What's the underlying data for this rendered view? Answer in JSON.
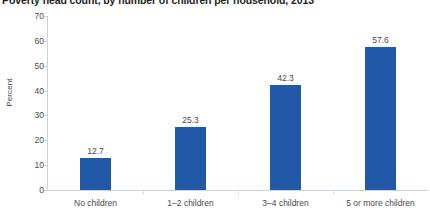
{
  "chart_data": {
    "type": "bar",
    "title": "Poverty head count, by number of children per household, 2013",
    "xlabel": "",
    "ylabel": "Percent",
    "categories": [
      "No children",
      "1–2 children",
      "3–4 children",
      "5 or more children"
    ],
    "values": [
      12.7,
      25.3,
      42.3,
      57.6
    ],
    "value_labels": [
      "12.7",
      "25.3",
      "42.3",
      "57.6"
    ],
    "ylim": [
      0,
      70
    ],
    "ytick_values": [
      0,
      10,
      20,
      30,
      40,
      50,
      60,
      70
    ],
    "ytick_labels": [
      "0",
      "10",
      "20",
      "30",
      "40",
      "50",
      "60",
      "70"
    ],
    "grid": false,
    "legend": false,
    "legend_position": "none",
    "series": [
      {
        "name": "Poverty head count",
        "values": [
          12.7,
          25.3,
          42.3,
          57.6
        ]
      }
    ],
    "colors": {
      "bar": "#2159a8",
      "title_text": "#231f20",
      "tick_text": "#4a4a4a",
      "axis_line": "#c9d4e2",
      "background": "#ffffff"
    }
  }
}
